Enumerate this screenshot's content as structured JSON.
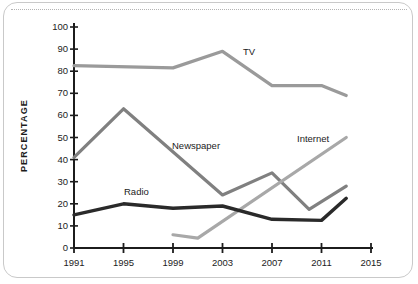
{
  "chart_data": {
    "type": "line",
    "title": "",
    "xlabel": "",
    "ylabel": "PERCENTAGE",
    "xlim": [
      1991,
      2015
    ],
    "ylim": [
      0,
      100
    ],
    "grid": false,
    "legend_position": "inline-annotations",
    "x_ticks": [
      "1991",
      "1995",
      "1999",
      "2003",
      "2007",
      "2011",
      "2015"
    ],
    "y_ticks": [
      "0",
      "10",
      "20",
      "30",
      "40",
      "50",
      "60",
      "70",
      "80",
      "90",
      "100"
    ],
    "series": [
      {
        "name": "TV",
        "color": "#9a9a9a",
        "x": [
          1991,
          1999,
          2003,
          2007,
          2011,
          2013
        ],
        "values": [
          82.5,
          81.5,
          89,
          73.5,
          73.5,
          69
        ]
      },
      {
        "name": "Newspaper",
        "color": "#808080",
        "x": [
          1991,
          1995,
          2003,
          2007,
          2010,
          2013
        ],
        "values": [
          41,
          63,
          24,
          34,
          17.5,
          28
        ]
      },
      {
        "name": "Internet",
        "color": "#a8a8a8",
        "x": [
          1999,
          2001,
          2013
        ],
        "values": [
          6,
          4.5,
          50
        ]
      },
      {
        "name": "Radio",
        "color": "#2a2a2a",
        "x": [
          1991,
          1995,
          1999,
          2003,
          2007,
          2011,
          2013
        ],
        "values": [
          15,
          20,
          18,
          19,
          13,
          12.5,
          22.5
        ]
      }
    ],
    "annotations": [
      {
        "text": "TV",
        "x": 243,
        "y": 46
      },
      {
        "text": "Newspaper",
        "x": 172,
        "y": 140
      },
      {
        "text": "Internet",
        "x": 297,
        "y": 133
      },
      {
        "text": "Radio",
        "x": 124,
        "y": 186
      }
    ]
  },
  "axes": {
    "y_title": "PERCENTAGE",
    "y_tick_labels": [
      "100",
      "90",
      "80",
      "70",
      "60",
      "50",
      "40",
      "30",
      "20",
      "10",
      "0"
    ],
    "x_tick_labels": [
      "1991",
      "1995",
      "1999",
      "2003",
      "2007",
      "2011",
      "2015"
    ]
  }
}
